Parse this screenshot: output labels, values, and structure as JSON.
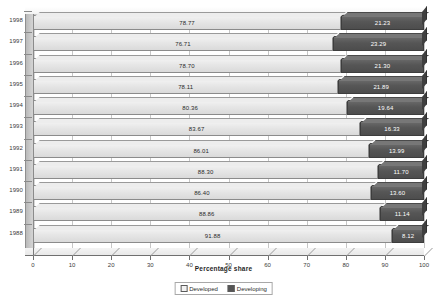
{
  "chart_data": {
    "type": "bar",
    "title": "",
    "subtitle": "",
    "xlabel": "Percentage share",
    "ylabel": "",
    "xlim": [
      0,
      100
    ],
    "xticks": [
      0,
      10,
      20,
      30,
      40,
      50,
      60,
      70,
      80,
      90,
      100
    ],
    "grid": true,
    "orientation": "horizontal",
    "stacked": true,
    "stack_total": 100,
    "legend_position": "bottom",
    "categories": [
      "1998",
      "1997",
      "1996",
      "1995",
      "1994",
      "1993",
      "1992",
      "1991",
      "1990",
      "1989",
      "1988"
    ],
    "series": [
      {
        "name": "Developed",
        "color": "#e6e6e6",
        "values": [
          78.77,
          76.71,
          78.7,
          78.11,
          80.36,
          83.67,
          86.01,
          88.3,
          86.4,
          88.86,
          91.88
        ],
        "labels": [
          "78.77",
          "76.71",
          "78.70",
          "78.11",
          "80.36",
          "83.67",
          "86.01",
          "88.30",
          "86.40",
          "88.86",
          "91.88"
        ]
      },
      {
        "name": "Developing",
        "color": "#555555",
        "values": [
          21.23,
          23.29,
          21.3,
          21.89,
          19.64,
          16.33,
          13.99,
          11.7,
          13.6,
          11.14,
          8.12
        ],
        "labels": [
          "21.23",
          "23.29",
          "21.30",
          "21.89",
          "19.64",
          "16.33",
          "13.99",
          "11.70",
          "13.60",
          "11.14",
          "8.12"
        ]
      }
    ]
  },
  "legend": {
    "items": [
      {
        "label": "Developed",
        "swatch": "developed-swatch-icon"
      },
      {
        "label": "Developing",
        "swatch": "developing-swatch-icon"
      }
    ]
  },
  "axis": {
    "x_title": "Percentage share",
    "tick_labels": [
      "0",
      "10",
      "20",
      "30",
      "40",
      "50",
      "60",
      "70",
      "80",
      "90",
      "100"
    ]
  },
  "colors": {
    "developed": "#e6e6e6",
    "developing": "#555555",
    "axis": "#6f6f6f",
    "grid": "#c6c6c6",
    "background": "#ffffff"
  }
}
